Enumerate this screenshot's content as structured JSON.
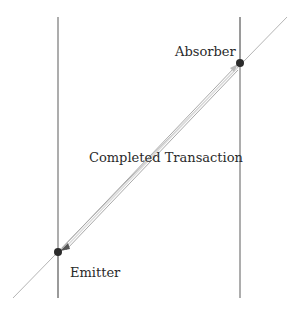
{
  "diagram": {
    "type": "spacetime-transaction",
    "labels": {
      "absorber": "Absorber",
      "transaction": "Completed Transaction",
      "emitter": "Emitter"
    },
    "nodes": [
      {
        "id": "absorber",
        "label": "Absorber",
        "x": 240,
        "y": 63
      },
      {
        "id": "emitter",
        "label": "Emitter",
        "x": 58,
        "y": 252
      }
    ],
    "worldlines": [
      {
        "id": "emitter-worldline",
        "x": 58,
        "y1": 17,
        "y2": 298
      },
      {
        "id": "absorber-worldline",
        "x": 240,
        "y1": 17,
        "y2": 298
      }
    ],
    "light_line": {
      "x1": 13,
      "y1": 298,
      "x2": 287,
      "y2": 17
    },
    "colors": {
      "worldline": "#8a8a8a",
      "light_line": "#b5b5b5",
      "node": "#2b2b2b",
      "transaction_arrow": "#9a9a9a",
      "text": "#2a2a2a"
    }
  }
}
